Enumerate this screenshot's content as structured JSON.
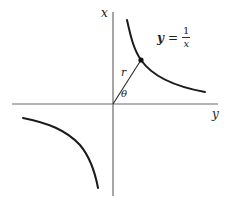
{
  "diagram": {
    "type": "hyperbola-polar-illustration",
    "axes": {
      "vertical_label": "x",
      "horizontal_label": "y"
    },
    "curve": {
      "equation_lhs": "y",
      "equation_equals": "=",
      "equation_numerator": "1",
      "equation_denominator": "x",
      "branches": [
        "upper-right",
        "lower-left"
      ]
    },
    "radius_label": "r",
    "angle_label": "θ",
    "colors": {
      "axis": "#6a6a6a",
      "curve": "#1a1a1a",
      "text": "#222222",
      "background": "#ffffff"
    }
  }
}
